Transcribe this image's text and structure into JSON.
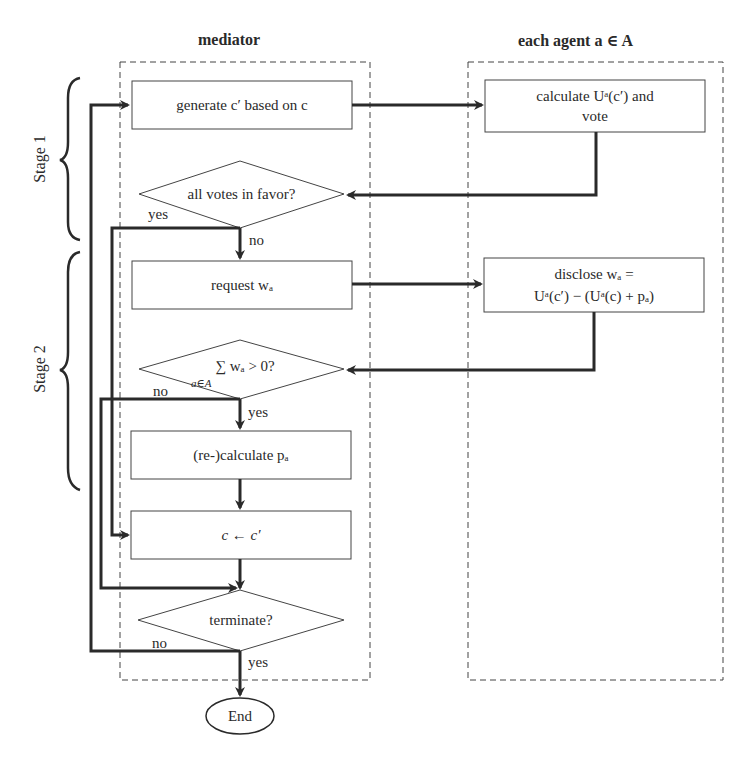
{
  "headers": {
    "mediator": "mediator",
    "agent": "each agent a ∈ A"
  },
  "stages": {
    "stage1": "Stage 1",
    "stage2": "Stage 2"
  },
  "nodes": {
    "generate": "generate c′ based on c",
    "vote_check": "all votes in favor?",
    "request": "request wₐ",
    "sum_check": "∑ wₐ > 0?",
    "sum_subscript": "a∈A",
    "recalculate": "(re-)calculate pₐ",
    "assign": "c ← c′",
    "terminate": "terminate?",
    "end": "End",
    "agent_calc_line1": "calculate Uᵃ(c′) and",
    "agent_calc_line2": "vote",
    "agent_disclose_line1": "disclose wₐ =",
    "agent_disclose_line2": "Uᵃ(c′) − (Uᵃ(c) + pₐ)"
  },
  "edge_labels": {
    "vote_yes": "yes",
    "vote_no": "no",
    "sum_no": "no",
    "sum_yes": "yes",
    "term_no": "no",
    "term_yes": "yes"
  },
  "colors": {
    "line": "#2a2a2a",
    "background": "#ffffff"
  }
}
